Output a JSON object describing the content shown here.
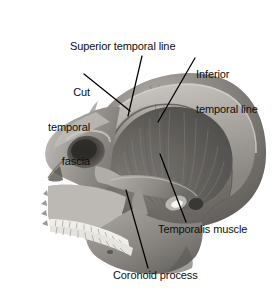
{
  "figure": {
    "type": "anatomical-illustration",
    "orientation": "left lateral, face toward left",
    "rendering": "grayscale photograph",
    "background_color": "#ffffff",
    "leader_line_color": "#000000",
    "bone_tone": "#8e8b86",
    "muscle_tone": "#6d6a66",
    "cranium_tone": "#7e7b77"
  },
  "labels": {
    "superior_temporal_line": "Superior temporal line",
    "inferior_temporal_line_1": "Inferior",
    "inferior_temporal_line_2": "temporal line",
    "cut_temporal_fascia_1": "Cut",
    "cut_temporal_fascia_2": "temporal",
    "cut_temporal_fascia_3": "fascia",
    "temporalis_muscle": "Temporalis muscle",
    "coronoid_process": "Coronoid process"
  },
  "annotations": [
    {
      "name": "superior-temporal-line",
      "text": "Superior temporal line",
      "anchor": "cranium upper ridge",
      "lines": 1
    },
    {
      "name": "inferior-temporal-line",
      "text": "Inferior temporal line",
      "anchor": "cranium inner ridge",
      "lines": 2
    },
    {
      "name": "cut-temporal-fascia",
      "text": "Cut temporal fascia",
      "anchor": "fascia margin above muscle",
      "lines": 3
    },
    {
      "name": "temporalis-muscle",
      "text": "Temporalis muscle",
      "anchor": "fan-shaped muscle belly",
      "lines": 1
    },
    {
      "name": "coronoid-process",
      "text": "Coronoid process",
      "anchor": "mandibular coronoid process",
      "lines": 1
    }
  ],
  "divider": {
    "color_start": "#9d9d9d",
    "color_end": "#ffffff"
  }
}
